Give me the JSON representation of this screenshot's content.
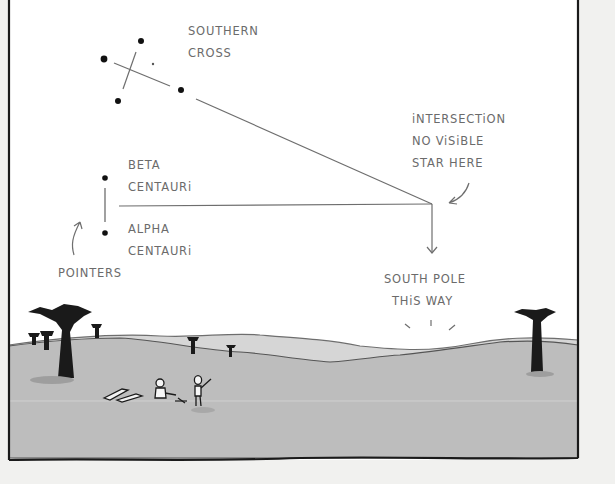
{
  "labels": {
    "southern_cross": [
      "SOUTHERN",
      "CROSS"
    ],
    "beta_centauri": [
      "BETA",
      "CENTAURi"
    ],
    "alpha_centauri": [
      "ALPHA",
      "CENTAURi"
    ],
    "pointers": "POINTERS",
    "intersection": [
      "iNTERSECTiON",
      "NO ViSiBLE",
      "STAR HERE"
    ],
    "south_pole": [
      "SOUTH POLE",
      "THiS WAY"
    ]
  },
  "colors": {
    "sky": "#ffffff",
    "ground": "#bdbdbd",
    "far_hills": "#d6d6d6",
    "ink": "#1a1a1a",
    "line": "#6e6e6e",
    "paper": "#f1f1ef"
  }
}
